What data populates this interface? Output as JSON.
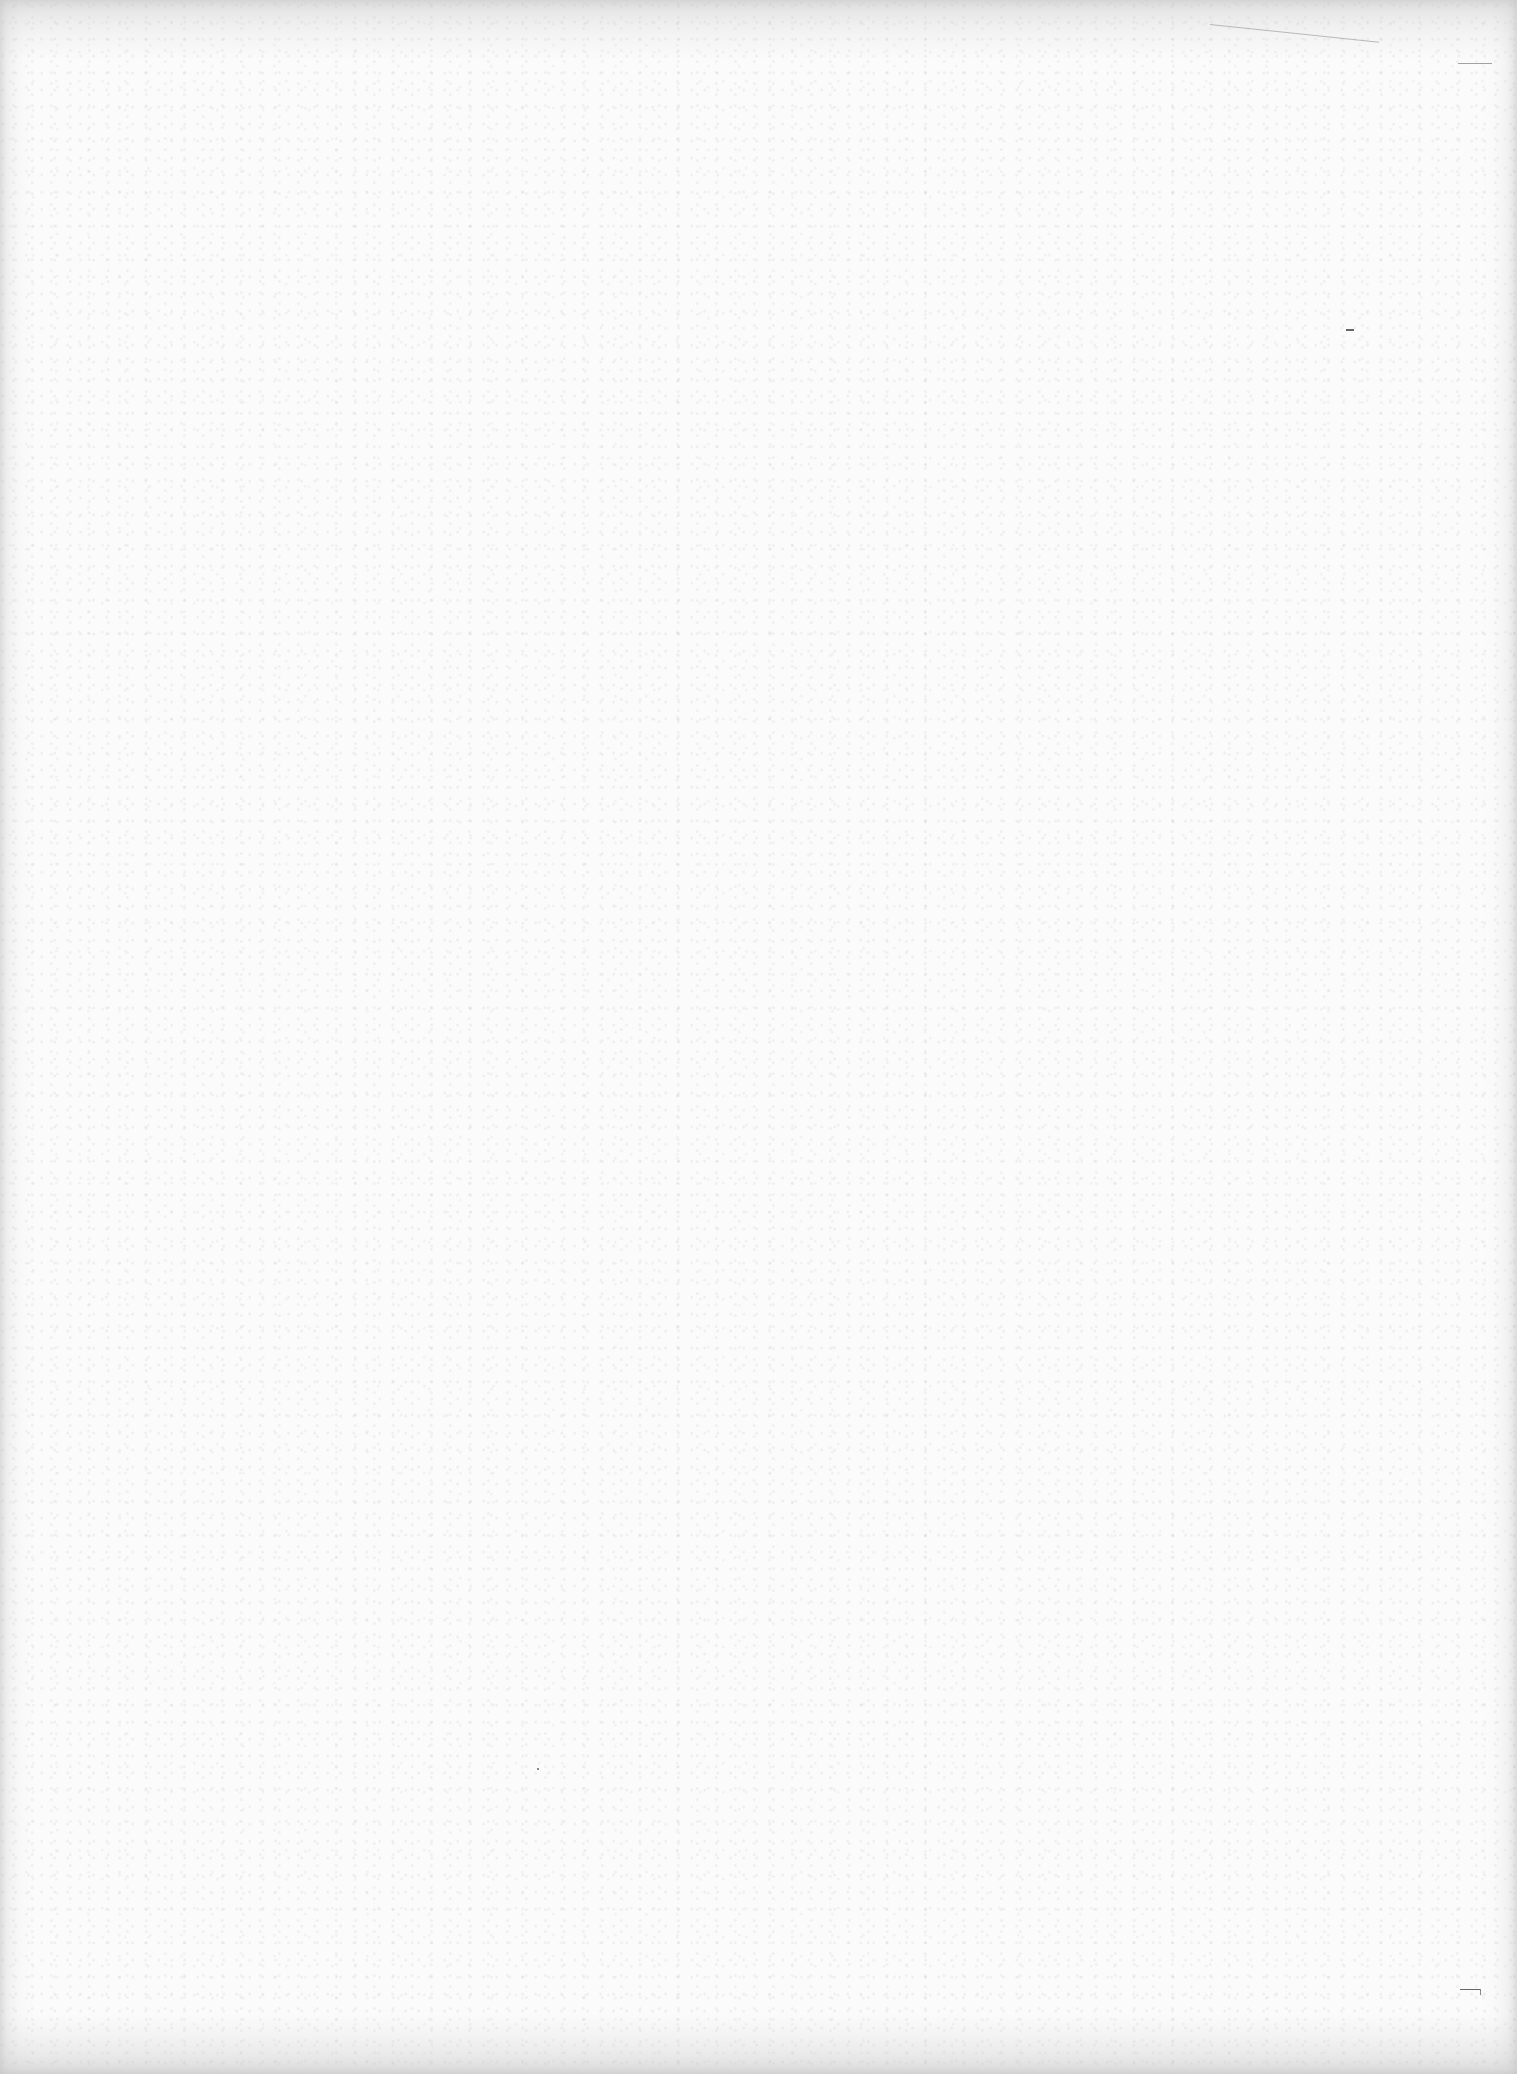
{
  "page": {
    "type": "blank-scanned-page",
    "background_color": "#fbfbfb",
    "text_content": []
  }
}
